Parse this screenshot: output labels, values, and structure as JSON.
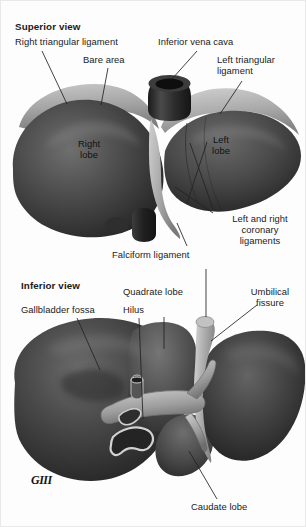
{
  "figure": {
    "title_superior": "Superior view",
    "title_inferior": "Inferior view",
    "signature": "GIII"
  },
  "superior_view": {
    "heading": "Superior view",
    "labels": [
      {
        "id": "right-triangular-ligament",
        "text": "Right triangular ligament"
      },
      {
        "id": "bare-area",
        "text": "Bare area"
      },
      {
        "id": "inferior-vena-cava",
        "text": "Inferior vena cava"
      },
      {
        "id": "left-triangular-ligament",
        "text": "Left triangular\nligament"
      },
      {
        "id": "right-lobe",
        "text": "Right\nlobe"
      },
      {
        "id": "left-lobe",
        "text": "Left\nlobe"
      },
      {
        "id": "coronary-ligaments",
        "text": "Left and right\ncoronary\nligaments"
      },
      {
        "id": "falciform-ligament",
        "text": "Falciform ligament"
      }
    ]
  },
  "inferior_view": {
    "heading": "Inferior view",
    "labels": [
      {
        "id": "gallbladder-fossa",
        "text": "Gallbladder fossa"
      },
      {
        "id": "quadrate-lobe",
        "text": "Quadrate lobe"
      },
      {
        "id": "hilus",
        "text": "Hilus"
      },
      {
        "id": "umbilical-fissure",
        "text": "Umbilical\nfissure"
      },
      {
        "id": "caudate-lobe",
        "text": "Caudate lobe"
      }
    ]
  },
  "colors": {
    "background": "#fdfdfd",
    "text": "#1b1b1b",
    "leader_line": "#2a2a2a",
    "liver_dark": "#3a3a3a",
    "liver_mid": "#555555",
    "liver_light": "#8e8e8e",
    "bare_area": "#a8a8a8",
    "vessel": "#b9b9b9",
    "vena_cava": "#2b2b2b"
  }
}
